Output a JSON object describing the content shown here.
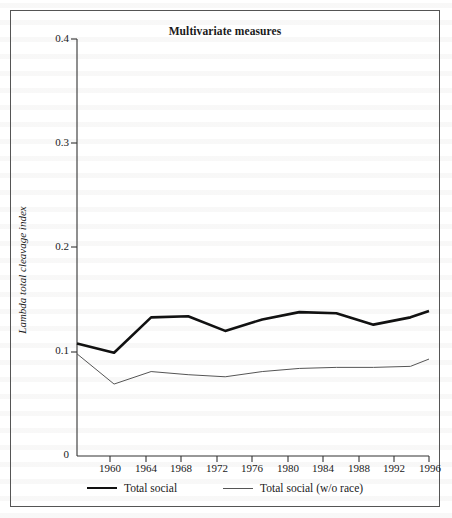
{
  "figure": {
    "title": "Multivariate measures"
  },
  "axes": {
    "ylabel": "Lambda total cleavage index",
    "yticks": [
      "0",
      "0.1",
      "0.2",
      "0.3",
      "0.4"
    ],
    "xticks": [
      "1960",
      "1964",
      "1968",
      "1972",
      "1976",
      "1980",
      "1984",
      "1988",
      "1992",
      "1996"
    ]
  },
  "legend": {
    "items": [
      {
        "label": "Total social",
        "style": "thick-black"
      },
      {
        "label": "Total social (w/o race)",
        "style": "thin-gray"
      }
    ]
  },
  "colors": {
    "series_total_social": "#111111",
    "series_total_social_wo_race": "#555555",
    "frame": "#555555",
    "axis": "#333333"
  },
  "chart_data": {
    "type": "line",
    "title": "Multivariate measures",
    "xlabel": "",
    "ylabel": "Lambda total cleavage index",
    "xlim": [
      1958,
      1996
    ],
    "ylim": [
      0,
      0.4
    ],
    "yticks": [
      0,
      0.1,
      0.2,
      0.3,
      0.4
    ],
    "xticks": [
      1960,
      1964,
      1968,
      1972,
      1976,
      1980,
      1984,
      1988,
      1992,
      1996
    ],
    "grid": false,
    "legend_position": "below-axes",
    "x": [
      1958,
      1962,
      1966,
      1970,
      1974,
      1978,
      1982,
      1986,
      1990,
      1994,
      1996
    ],
    "series": [
      {
        "name": "Total social",
        "values": [
          0.108,
          0.099,
          0.133,
          0.134,
          0.12,
          0.131,
          0.138,
          0.137,
          0.126,
          0.133,
          0.139
        ]
      },
      {
        "name": "Total social (w/o race)",
        "values": [
          0.098,
          0.069,
          0.081,
          0.078,
          0.076,
          0.081,
          0.084,
          0.085,
          0.085,
          0.086,
          0.093
        ]
      }
    ]
  }
}
